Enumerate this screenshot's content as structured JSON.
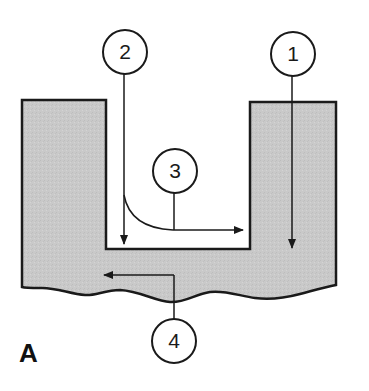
{
  "figure": {
    "panel_label": "A",
    "colors": {
      "material_fill": "#c9c9c9",
      "outline": "#1a1a1a",
      "background": "#ffffff"
    },
    "callouts": [
      {
        "id": "1",
        "label": "1",
        "description": "vertical arrow pointing down into right wall region"
      },
      {
        "id": "2",
        "label": "2",
        "description": "vertical arrow pointing down along left inner wall of trench"
      },
      {
        "id": "3",
        "label": "3",
        "description": "curved line along trench bottom corner with arrow pointing right"
      },
      {
        "id": "4",
        "label": "4",
        "description": "arrow pointing left within substrate below trench"
      }
    ],
    "shapes": {
      "substrate": "U-shaped gray material with rectangular trench notch and wavy bottom edge"
    }
  }
}
